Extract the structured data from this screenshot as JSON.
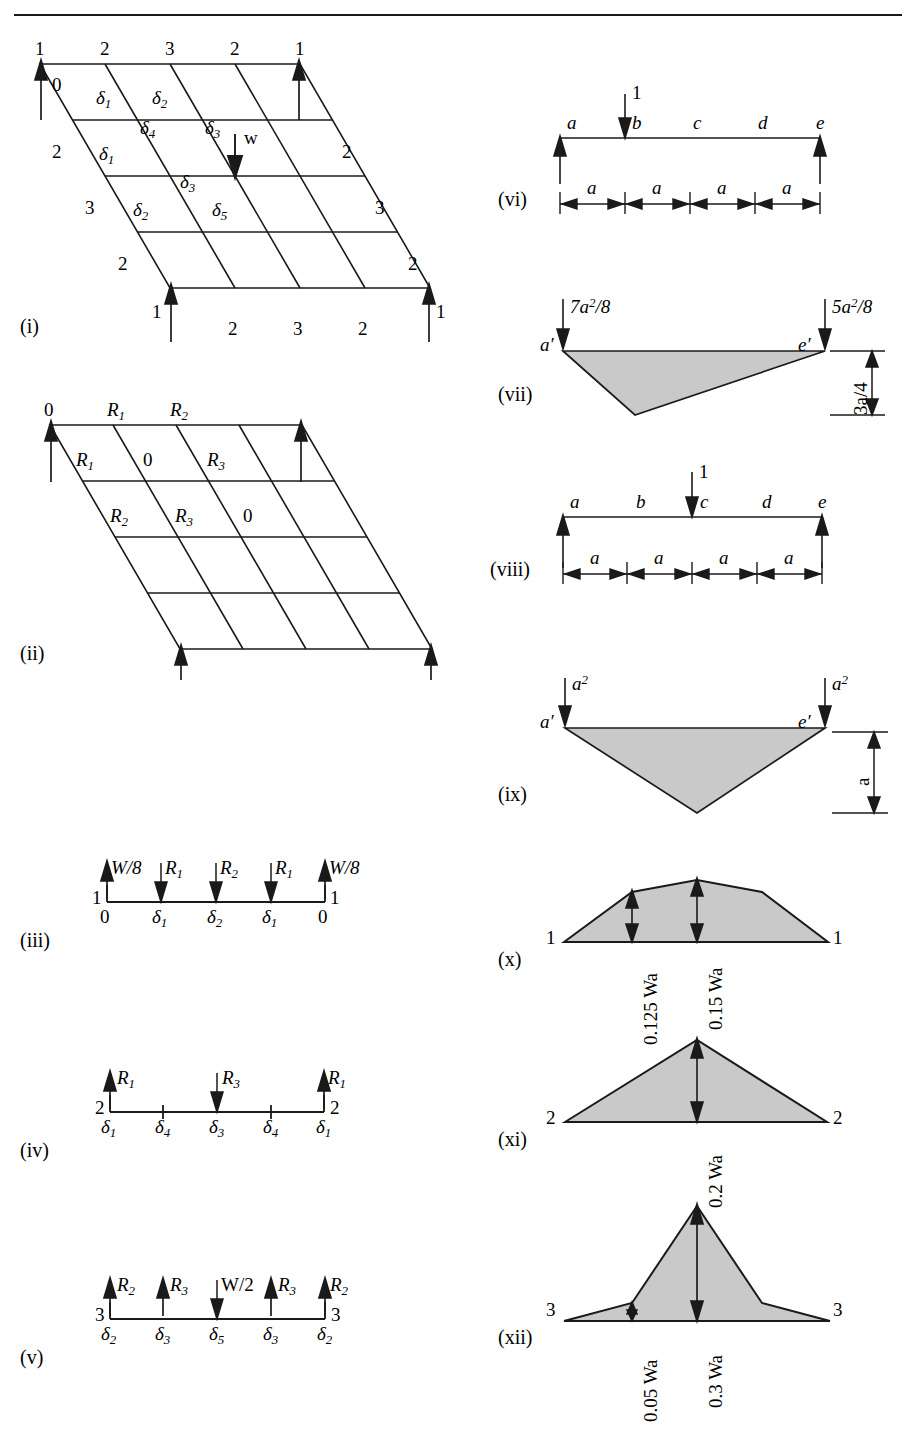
{
  "page": {
    "width": 916,
    "height": 1432,
    "background": "#ffffff",
    "ink": "#1a1a1a",
    "shade": "#c9c9c9"
  },
  "figures": {
    "i": {
      "caption": "(i)",
      "description": "Skewed grillage grid with load W and deflection labels",
      "top_edge_labels": [
        "1",
        "2",
        "3",
        "2",
        "1"
      ],
      "bottom_edge_labels": [
        "1",
        "2",
        "3",
        "2",
        "1"
      ],
      "left_edge_labels": [
        "2",
        "3",
        "2"
      ],
      "right_edge_labels": [
        "2",
        "3",
        "2"
      ],
      "interior_labels": [
        "0",
        "δ₁",
        "δ₂",
        "δ₄",
        "δ₃",
        "δ₁",
        "δ₃",
        "δ₂",
        "δ₅"
      ],
      "load_label": "w",
      "support_count": 4
    },
    "ii": {
      "caption": "(ii)",
      "description": "Skewed grillage grid with reaction labels",
      "labels": [
        "0",
        "R₁",
        "R₂",
        "R₁",
        "0",
        "R₃",
        "R₂",
        "R₃",
        "0"
      ],
      "support_count": 4
    },
    "iii": {
      "caption": "(iii)",
      "description": "Beam 1 free body: loads W/8, R1, R2, R1, W/8",
      "end_labels": [
        "1",
        "1"
      ],
      "force_labels": [
        "W/8",
        "R₁",
        "R₂",
        "R₁",
        "W/8"
      ],
      "force_dirs": [
        "up",
        "down",
        "down",
        "down",
        "up"
      ],
      "deflection_labels": [
        "0",
        "δ₁",
        "δ₂",
        "δ₁",
        "0"
      ]
    },
    "iv": {
      "caption": "(iv)",
      "description": "Beam 2 free body: loads R1, R3, R1",
      "end_labels": [
        "2",
        "2"
      ],
      "force_labels": [
        "R₁",
        "R₃",
        "R₁"
      ],
      "force_dirs": [
        "up",
        "down",
        "up"
      ],
      "deflection_labels": [
        "δ₁",
        "δ₄",
        "δ₃",
        "δ₄",
        "δ₁"
      ]
    },
    "v": {
      "caption": "(v)",
      "description": "Beam 3 free body: loads R2, R3, W/2, R3, R2",
      "end_labels": [
        "3",
        "3"
      ],
      "force_labels": [
        "R₂",
        "R₃",
        "W/2",
        "R₃",
        "R₂"
      ],
      "force_dirs": [
        "up",
        "up",
        "down",
        "up",
        "up"
      ],
      "deflection_labels": [
        "δ₂",
        "δ₃",
        "δ₅",
        "δ₃",
        "δ₂"
      ]
    },
    "vi": {
      "caption": "(vi)",
      "description": "Simply supported beam with unit load at b",
      "node_labels": [
        "a",
        "b",
        "c",
        "d",
        "e"
      ],
      "load_label": "1",
      "span_labels": [
        "a",
        "a",
        "a",
        "a"
      ]
    },
    "vii": {
      "caption": "(vii)",
      "description": "Conjugate beam / area diagram for load at b",
      "end_labels": [
        "a′",
        "e′"
      ],
      "left_force": "7a²/8",
      "right_force": "5a²/8",
      "depth_label": "3a/4"
    },
    "viii": {
      "caption": "(viii)",
      "description": "Simply supported beam with unit load at c",
      "node_labels": [
        "a",
        "b",
        "c",
        "d",
        "e"
      ],
      "load_label": "1",
      "span_labels": [
        "a",
        "a",
        "a",
        "a"
      ]
    },
    "ix": {
      "caption": "(ix)",
      "description": "Conjugate beam / area diagram for load at c",
      "end_labels": [
        "a′",
        "e′"
      ],
      "left_force": "a²",
      "right_force": "a²",
      "depth_label": "a"
    },
    "x": {
      "caption": "(x)",
      "description": "Bending moment diagram for beam 1",
      "end_labels": [
        "1",
        "1"
      ],
      "ordinates": [
        "0.125 Wa",
        "0.15 Wa"
      ]
    },
    "xi": {
      "caption": "(xi)",
      "description": "Bending moment diagram for beam 2",
      "end_labels": [
        "2",
        "2"
      ],
      "ordinates": [
        "0.2 Wa"
      ]
    },
    "xii": {
      "caption": "(xii)",
      "description": "Bending moment diagram for beam 3",
      "end_labels": [
        "3",
        "3"
      ],
      "ordinates": [
        "0.05 Wa",
        "0.3 Wa"
      ]
    }
  },
  "chart_data": {
    "type": "line",
    "series": [
      {
        "name": "Beam 1 (x)",
        "ordinate_labels": [
          "0.125 Wa",
          "0.15 Wa"
        ],
        "values": [
          0,
          0.125,
          0.15,
          0.125,
          0
        ]
      },
      {
        "name": "Beam 2 (xi)",
        "ordinate_labels": [
          "0.2 Wa"
        ],
        "values": [
          0,
          0.1,
          0.2,
          0.1,
          0
        ]
      },
      {
        "name": "Beam 3 (xii)",
        "ordinate_labels": [
          "0.05 Wa",
          "0.3 Wa"
        ],
        "values": [
          0,
          0.05,
          0.3,
          0.05,
          0
        ]
      }
    ],
    "units": "Wa",
    "xlabel": "",
    "ylabel": "Bending moment"
  }
}
